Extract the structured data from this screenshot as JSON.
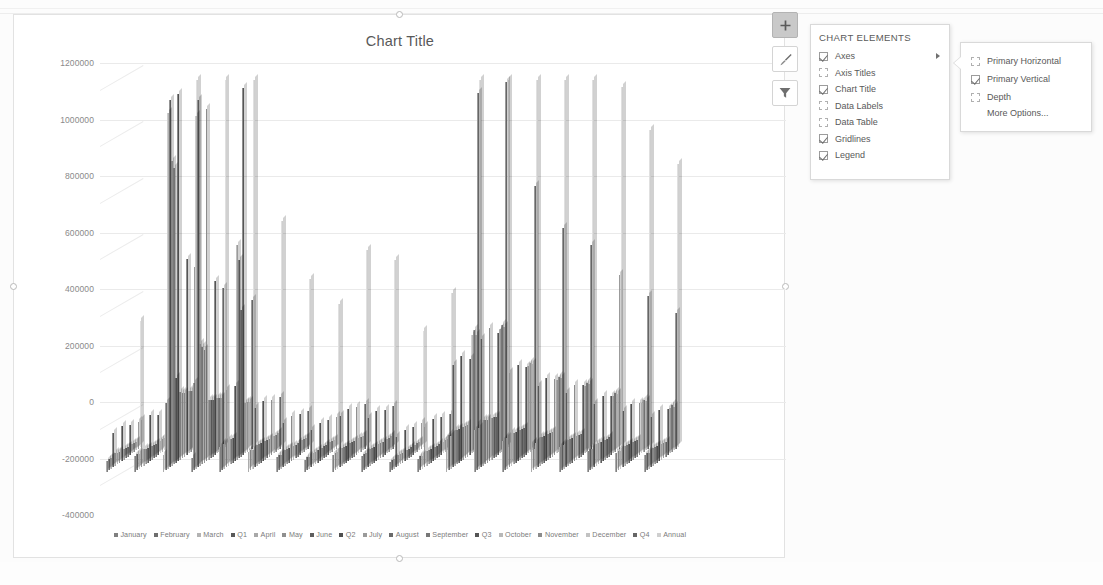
{
  "chart": {
    "title": "Chart Title",
    "frame_label": "chart-object",
    "side_buttons": [
      {
        "name": "chart-elements-button",
        "icon": "plus-icon",
        "active": true
      },
      {
        "name": "chart-styles-button",
        "icon": "brush-icon",
        "active": false
      },
      {
        "name": "chart-filters-button",
        "icon": "funnel-icon",
        "active": false
      }
    ]
  },
  "chart_data": {
    "type": "bar",
    "subtype": "3-D clustered column",
    "title": "Chart Title",
    "xlabel": "",
    "ylabel": "",
    "ylim": [
      -400000,
      1200000
    ],
    "ytick_labels": [
      "1200000",
      "1000000",
      "800000",
      "600000",
      "400000",
      "200000",
      "0",
      "-200000",
      "-400000"
    ],
    "ytick_values": [
      1200000,
      1000000,
      800000,
      600000,
      400000,
      200000,
      0,
      -200000,
      -400000
    ],
    "grid": true,
    "legend_position": "bottom",
    "legend": [
      {
        "label": "January",
        "color": "#808080"
      },
      {
        "label": "February",
        "color": "#6e6e6e"
      },
      {
        "label": "March",
        "color": "#b3b3b3"
      },
      {
        "label": "Q1",
        "color": "#595959"
      },
      {
        "label": "April",
        "color": "#a8a8a8"
      },
      {
        "label": "May",
        "color": "#8f8f8f"
      },
      {
        "label": "June",
        "color": "#5e5e5e"
      },
      {
        "label": "Q2",
        "color": "#4f4f4f"
      },
      {
        "label": "July",
        "color": "#9a9a9a"
      },
      {
        "label": "August",
        "color": "#6a6a6a"
      },
      {
        "label": "September",
        "color": "#777777"
      },
      {
        "label": "Q3",
        "color": "#555555"
      },
      {
        "label": "October",
        "color": "#b8b8b8"
      },
      {
        "label": "November",
        "color": "#8b8b8b"
      },
      {
        "label": "December",
        "color": "#c2c2c2"
      },
      {
        "label": "Q4",
        "color": "#666666"
      },
      {
        "label": "Annual",
        "color": "#cfcfcf"
      }
    ],
    "series": [
      {
        "name": "January",
        "values": [
          40000,
          55000,
          62000,
          48000,
          90000,
          70000,
          52000,
          44000,
          61000,
          58000,
          36000,
          47000,
          120000,
          150000,
          110000,
          95000,
          88000,
          74000,
          66000,
          59000
        ]
      },
      {
        "name": "February",
        "values": [
          42000,
          60000,
          240000,
          310000,
          95000,
          72000,
          55000,
          46000,
          63000,
          60000,
          38000,
          50000,
          125000,
          160000,
          115000,
          99000,
          91000,
          77000,
          68000,
          61000
        ]
      },
      {
        "name": "March",
        "values": [
          38000,
          52000,
          1260000,
          1250000,
          88000,
          68000,
          50000,
          43000,
          59000,
          56000,
          35000,
          45000,
          118000,
          145000,
          108000,
          93000,
          86000,
          72000,
          64000,
          57000
        ]
      },
      {
        "name": "Q1",
        "values": [
          120000,
          167000,
          1562000,
          1608000,
          273000,
          210000,
          157000,
          133000,
          183000,
          174000,
          109000,
          142000,
          363000,
          455000,
          333000,
          287000,
          265000,
          223000,
          198000,
          177000
        ]
      },
      {
        "name": "April",
        "values": [
          45000,
          58000,
          1080000,
          430000,
          92000,
          74000,
          56000,
          47000,
          64000,
          61000,
          39000,
          51000,
          128000,
          163000,
          117000,
          101000,
          93000,
          79000,
          70000,
          63000
        ]
      },
      {
        "name": "May",
        "values": [
          41000,
          54000,
          1050000,
          415000,
          89000,
          71000,
          53000,
          45000,
          62000,
          59000,
          37000,
          49000,
          123000,
          157000,
          112000,
          97000,
          90000,
          76000,
          67000,
          60000
        ]
      },
      {
        "name": "June",
        "values": [
          39000,
          51000,
          300000,
          400000,
          86000,
          69000,
          51000,
          44000,
          60000,
          57000,
          36000,
          48000,
          120000,
          152000,
          110000,
          95000,
          87000,
          74000,
          65000,
          58000
        ]
      },
      {
        "name": "Q2",
        "values": [
          125000,
          163000,
          2430000,
          1245000,
          267000,
          214000,
          160000,
          136000,
          186000,
          177000,
          112000,
          148000,
          371000,
          472000,
          339000,
          293000,
          270000,
          229000,
          202000,
          181000
        ]
      },
      {
        "name": "July",
        "values": [
          36000,
          49000,
          240000,
          210000,
          760000,
          66000,
          49000,
          42000,
          58000,
          55000,
          34000,
          46000,
          116000,
          148000,
          106000,
          92000,
          84000,
          71000,
          63000,
          56000
        ]
      },
      {
        "name": "August",
        "values": [
          35000,
          47000,
          230000,
          205000,
          700000,
          64000,
          48000,
          41000,
          56000,
          53000,
          33000,
          44000,
          113000,
          144000,
          103000,
          89000,
          82000,
          69000,
          61000,
          54000
        ]
      },
      {
        "name": "September",
        "values": [
          34000,
          46000,
          225000,
          200000,
          520000,
          63000,
          47000,
          40000,
          55000,
          52000,
          32000,
          43000,
          111000,
          141000,
          101000,
          87000,
          80000,
          68000,
          60000,
          53000
        ]
      },
      {
        "name": "Q3",
        "values": [
          105000,
          142000,
          695000,
          615000,
          1980000,
          193000,
          144000,
          123000,
          169000,
          160000,
          99000,
          133000,
          340000,
          433000,
          310000,
          268000,
          246000,
          208000,
          184000,
          163000
        ]
      },
      {
        "name": "October",
        "values": [
          33000,
          45000,
          220000,
          195000,
          180000,
          62000,
          46000,
          39000,
          54000,
          51000,
          31000,
          42000,
          420000,
          440000,
          310000,
          260000,
          240000,
          205000,
          180000,
          160000
        ]
      },
      {
        "name": "November",
        "values": [
          32000,
          44000,
          215000,
          190000,
          175000,
          61000,
          45000,
          38000,
          53000,
          50000,
          30000,
          41000,
          430000,
          450000,
          315000,
          265000,
          245000,
          210000,
          185000,
          165000
        ]
      },
      {
        "name": "December",
        "values": [
          31000,
          43000,
          210000,
          185000,
          170000,
          60000,
          44000,
          37000,
          52000,
          49000,
          29000,
          40000,
          410000,
          435000,
          305000,
          255000,
          235000,
          200000,
          175000,
          155000
        ]
      },
      {
        "name": "Q4",
        "values": [
          96000,
          132000,
          645000,
          570000,
          525000,
          183000,
          135000,
          114000,
          159000,
          150000,
          90000,
          123000,
          1260000,
          1325000,
          930000,
          780000,
          720000,
          615000,
          540000,
          480000
        ]
      },
      {
        "name": "Annual",
        "values": [
          446000,
          604000,
          5332000,
          4038000,
          3045000,
          800000,
          596000,
          506000,
          697000,
          661000,
          410000,
          546000,
          2334000,
          2685000,
          1912000,
          1628000,
          1501000,
          1275000,
          1124000,
          1001000
        ]
      }
    ]
  },
  "chart_elements_panel": {
    "header": "CHART ELEMENTS",
    "items": [
      {
        "label": "Axes",
        "checked": true,
        "has_submenu": true
      },
      {
        "label": "Axis Titles",
        "checked": false,
        "has_submenu": false
      },
      {
        "label": "Chart Title",
        "checked": true,
        "has_submenu": false
      },
      {
        "label": "Data Labels",
        "checked": false,
        "has_submenu": false
      },
      {
        "label": "Data Table",
        "checked": false,
        "has_submenu": false
      },
      {
        "label": "Gridlines",
        "checked": true,
        "has_submenu": false
      },
      {
        "label": "Legend",
        "checked": true,
        "has_submenu": false
      }
    ],
    "submenu": {
      "items": [
        {
          "label": "Primary Horizontal",
          "checked": false
        },
        {
          "label": "Primary Vertical",
          "checked": true
        },
        {
          "label": "Depth",
          "checked": false
        }
      ],
      "more_options": "More Options..."
    }
  },
  "status_bar": {
    "add_sheet_icon": "circled-plus-icon"
  }
}
